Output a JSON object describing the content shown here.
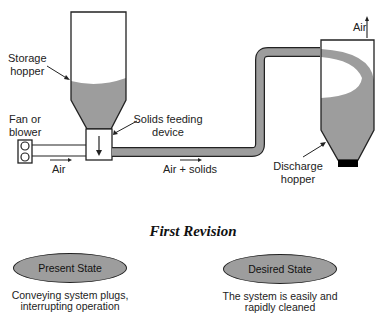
{
  "diagram": {
    "labels": {
      "storage_hopper_1": "Storage",
      "storage_hopper_2": "hopper",
      "fan_1": "Fan or",
      "fan_2": "blower",
      "feeder_1": "Solids feeding",
      "feeder_2": "device",
      "air": "Air",
      "air_solids": "Air + solids",
      "discharge_1": "Discharge",
      "discharge_2": "hopper",
      "air_out": "Air"
    },
    "colors": {
      "solids_fill": "#9d9d9d",
      "outline": "#222222",
      "base": "#000000"
    }
  },
  "revision": {
    "title": "First Revision",
    "present": {
      "label": "Present State",
      "desc_1": "Conveying system plugs,",
      "desc_2": "interrupting operation"
    },
    "desired": {
      "label": "Desired State",
      "desc_1": "The system is easily and",
      "desc_2": "rapidly cleaned"
    }
  }
}
